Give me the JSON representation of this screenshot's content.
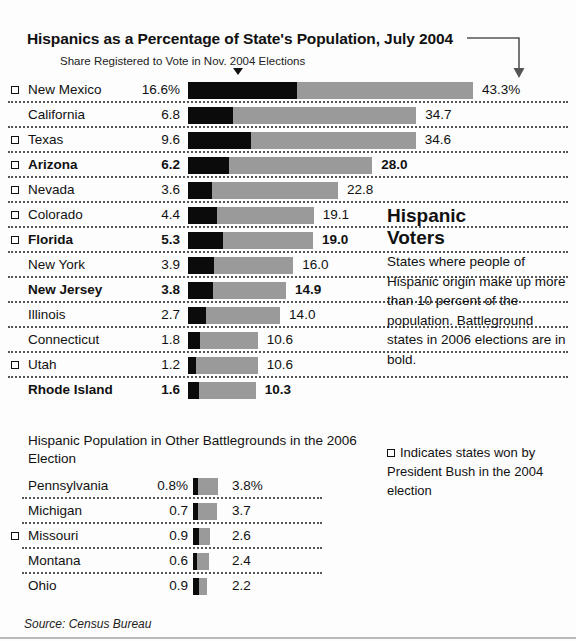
{
  "header": {
    "title": "Hispanics as a Percentage of State's Population, July 2004",
    "subtitle": "Share Registered to Vote in Nov. 2004 Elections"
  },
  "sidebar": {
    "heading_line1": "Hispanic",
    "heading_line2": "Voters",
    "body": "States where people of Hispanic origin make up more than 10 percent of the population. Battleground states in 2006 elections are in bold.",
    "legend_note": "Indicates states won by President Bush in the 2004 election"
  },
  "battleground_heading": "Hispanic Population in Other Battlegrounds in the 2006 Election",
  "source": "Source: Census Bureau",
  "chart_data": [
    {
      "type": "bar",
      "title": "Hispanics as a Percentage of State's Population, July 2004",
      "subtitle": "Share Registered to Vote in Nov. 2004 Elections",
      "xlabel": "",
      "ylabel": "",
      "orientation": "horizontal",
      "stacked_overlay": true,
      "xlim": [
        0,
        43.3
      ],
      "grid": false,
      "series": [
        {
          "name": "Share Registered to Vote in Nov. 2004 Elections",
          "color": "#0b0b0b"
        },
        {
          "name": "Hispanic Percentage of State Population",
          "color": "#9a9a9a"
        }
      ],
      "categories": [
        "New Mexico",
        "California",
        "Texas",
        "Arizona",
        "Nevada",
        "Colorado",
        "Florida",
        "New York",
        "New Jersey",
        "Illinois",
        "Connecticut",
        "Utah",
        "Rhode Island"
      ],
      "rows": [
        {
          "name": "New Mexico",
          "share": "16.6%",
          "share_value": 16.6,
          "total": "43.3%",
          "total_value": 43.3,
          "bush": true,
          "battleground": false
        },
        {
          "name": "California",
          "share": "6.8",
          "share_value": 6.8,
          "total": "34.7",
          "total_value": 34.7,
          "bush": false,
          "battleground": false
        },
        {
          "name": "Texas",
          "share": "9.6",
          "share_value": 9.6,
          "total": "34.6",
          "total_value": 34.6,
          "bush": true,
          "battleground": false
        },
        {
          "name": "Arizona",
          "share": "6.2",
          "share_value": 6.2,
          "total": "28.0",
          "total_value": 28.0,
          "bush": true,
          "battleground": true
        },
        {
          "name": "Nevada",
          "share": "3.6",
          "share_value": 3.6,
          "total": "22.8",
          "total_value": 22.8,
          "bush": true,
          "battleground": false
        },
        {
          "name": "Colorado",
          "share": "4.4",
          "share_value": 4.4,
          "total": "19.1",
          "total_value": 19.1,
          "bush": true,
          "battleground": false
        },
        {
          "name": "Florida",
          "share": "5.3",
          "share_value": 5.3,
          "total": "19.0",
          "total_value": 19.0,
          "bush": true,
          "battleground": true
        },
        {
          "name": "New York",
          "share": "3.9",
          "share_value": 3.9,
          "total": "16.0",
          "total_value": 16.0,
          "bush": false,
          "battleground": false
        },
        {
          "name": "New Jersey",
          "share": "3.8",
          "share_value": 3.8,
          "total": "14.9",
          "total_value": 14.9,
          "bush": false,
          "battleground": true
        },
        {
          "name": "Illinois",
          "share": "2.7",
          "share_value": 2.7,
          "total": "14.0",
          "total_value": 14.0,
          "bush": false,
          "battleground": false
        },
        {
          "name": "Connecticut",
          "share": "1.8",
          "share_value": 1.8,
          "total": "10.6",
          "total_value": 10.6,
          "bush": false,
          "battleground": false
        },
        {
          "name": "Utah",
          "share": "1.2",
          "share_value": 1.2,
          "total": "10.6",
          "total_value": 10.6,
          "bush": true,
          "battleground": false
        },
        {
          "name": "Rhode Island",
          "share": "1.6",
          "share_value": 1.6,
          "total": "10.3",
          "total_value": 10.3,
          "bush": false,
          "battleground": true
        }
      ]
    },
    {
      "type": "bar",
      "title": "Hispanic Population in Other Battlegrounds in the 2006 Election",
      "xlabel": "",
      "ylabel": "",
      "orientation": "horizontal",
      "stacked_overlay": true,
      "xlim": [
        0,
        43.3
      ],
      "grid": false,
      "series": [
        {
          "name": "Share Registered to Vote in Nov. 2004 Elections",
          "color": "#0b0b0b"
        },
        {
          "name": "Hispanic Percentage of State Population",
          "color": "#9a9a9a"
        }
      ],
      "categories": [
        "Pennsylvania",
        "Michigan",
        "Missouri",
        "Montana",
        "Ohio"
      ],
      "rows": [
        {
          "name": "Pennsylvania",
          "share": "0.8%",
          "share_value": 0.8,
          "total": "3.8%",
          "total_value": 3.8,
          "bush": false,
          "battleground": false
        },
        {
          "name": "Michigan",
          "share": "0.7",
          "share_value": 0.7,
          "total": "3.7",
          "total_value": 3.7,
          "bush": false,
          "battleground": false
        },
        {
          "name": "Missouri",
          "share": "0.9",
          "share_value": 0.9,
          "total": "2.6",
          "total_value": 2.6,
          "bush": true,
          "battleground": false
        },
        {
          "name": "Montana",
          "share": "0.6",
          "share_value": 0.6,
          "total": "2.4",
          "total_value": 2.4,
          "bush": false,
          "battleground": false
        },
        {
          "name": "Ohio",
          "share": "0.9",
          "share_value": 0.9,
          "total": "2.2",
          "total_value": 2.2,
          "bush": false,
          "battleground": false
        }
      ]
    }
  ],
  "colors": {
    "registered_bar": "#0b0b0b",
    "population_bar": "#9a9a9a",
    "background": "#fdfdfd",
    "text": "#111111"
  }
}
